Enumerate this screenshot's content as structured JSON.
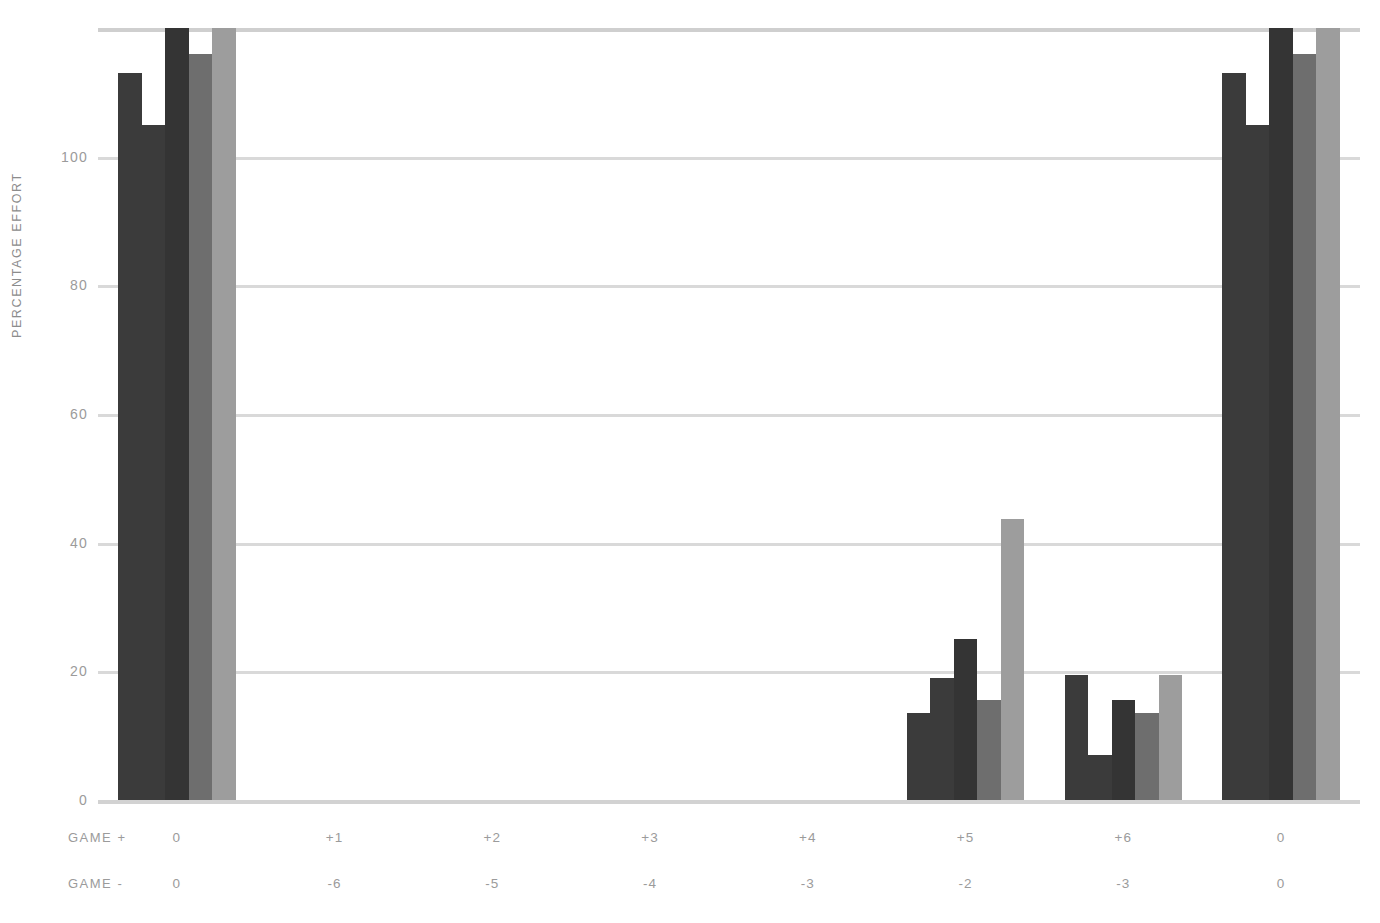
{
  "chart_data": {
    "type": "bar",
    "title": "",
    "subtitle": "",
    "xlabel": "",
    "ylabel": "PERCENTAGE EFFORT",
    "ylim": [
      0,
      120
    ],
    "yticks": [
      0,
      20,
      40,
      60,
      80,
      100
    ],
    "ytick_labels": [
      "0",
      "20",
      "40",
      "60",
      "80",
      "100"
    ],
    "grid": true,
    "legend": "none",
    "categories": [
      "0",
      "+1",
      "+2",
      "+3",
      "+4",
      "+5",
      "+6",
      "0"
    ],
    "category_rows": [
      {
        "label": "GAME +",
        "values": [
          "0",
          "+1",
          "+2",
          "+3",
          "+4",
          "+5",
          "+6",
          "0"
        ]
      },
      {
        "label": "GAME -",
        "values": [
          "0",
          "-6",
          "-5",
          "-4",
          "-3",
          "-2",
          "-3",
          "0"
        ]
      }
    ],
    "series": [
      {
        "name": "series-1",
        "color": "#3b3b3b",
        "values": [
          113,
          0,
          0,
          0,
          0,
          13.5,
          19.5,
          113
        ]
      },
      {
        "name": "series-2",
        "color": "#3b3b3b",
        "values": [
          105,
          0,
          0,
          0,
          0,
          19,
          7,
          105
        ]
      },
      {
        "name": "series-3",
        "color": "#343434",
        "values": [
          120,
          0,
          0,
          0,
          0,
          25,
          15.5,
          120
        ]
      },
      {
        "name": "series-4",
        "color": "#6e6e6e",
        "values": [
          116,
          0,
          0,
          0,
          0,
          15.5,
          13.5,
          116
        ]
      },
      {
        "name": "series-5",
        "color": "#9d9d9d",
        "values": [
          120,
          0,
          0,
          0,
          0,
          43.7,
          19.5,
          120
        ]
      }
    ],
    "colors": {
      "gridline": "#d9d9d9",
      "axis_text": "#9b9b9b",
      "background": "#ffffff"
    }
  }
}
